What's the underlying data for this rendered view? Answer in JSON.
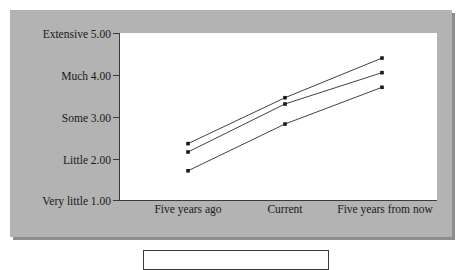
{
  "chart_data": {
    "type": "line",
    "title": "",
    "subtitle": "",
    "xlabel": "",
    "ylabel": "",
    "categories": [
      "Five years ago",
      "Current",
      "Five years from now"
    ],
    "ylim": [
      1.0,
      5.0
    ],
    "yticks": [
      1.0,
      2.0,
      3.0,
      4.0,
      5.0
    ],
    "ytick_labels": [
      "Very little 1.00",
      "Little 2.00",
      "Some 3.00",
      "Much 4.00",
      "Extensive 5.00"
    ],
    "grid": false,
    "legend_position": "bottom",
    "legend_entries": [],
    "annotations": [],
    "series": [
      {
        "name": "series-1",
        "values": [
          2.35,
          3.45,
          4.4
        ]
      },
      {
        "name": "series-2",
        "values": [
          2.15,
          3.3,
          4.05
        ]
      },
      {
        "name": "series-3",
        "values": [
          1.7,
          2.82,
          3.7
        ]
      }
    ]
  },
  "axes": {
    "y": {
      "ticks": [
        {
          "value": "5.00",
          "label": "Extensive 5.00"
        },
        {
          "value": "4.00",
          "label": "Much 4.00"
        },
        {
          "value": "3.00",
          "label": "Some 3.00"
        },
        {
          "value": "2.00",
          "label": "Little 2.00"
        },
        {
          "value": "1.00",
          "label": "Very little 1.00"
        }
      ]
    },
    "x": {
      "ticks": [
        {
          "label": "Five years ago"
        },
        {
          "label": "Current"
        },
        {
          "label": "Five years from now"
        }
      ]
    }
  },
  "legend": {
    "items": []
  },
  "colors": {
    "panel_background": "#b3b3b3",
    "plot_background": "#ffffff",
    "axis": "#3a3a3a",
    "line": "#2b2b2b",
    "marker": "#1a1a1a",
    "text": "#1a1a1a"
  }
}
